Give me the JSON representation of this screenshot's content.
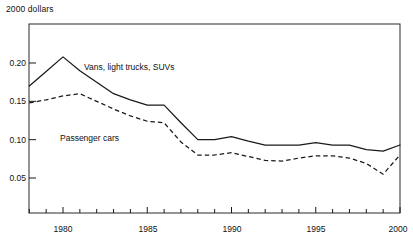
{
  "chart_data": {
    "type": "line",
    "title": "2000 dollars",
    "xlabel": "",
    "ylabel": "",
    "xlim": [
      1978,
      2000
    ],
    "ylim": [
      0.0,
      0.225
    ],
    "grid": false,
    "legend_position": "inline-annotations",
    "x_ticks_major": [
      1980,
      1985,
      1990,
      1995,
      2000
    ],
    "x_tick_labels": [
      "1980",
      "1985",
      "1990",
      "1995",
      "2000"
    ],
    "x_ticks_minor_every": 1,
    "y_ticks": [
      0.05,
      0.1,
      0.15,
      0.2
    ],
    "y_tick_labels": [
      "0.05",
      "0.10",
      "0.15",
      "0.20"
    ],
    "x": [
      1978,
      1979,
      1980,
      1981,
      1982,
      1983,
      1984,
      1985,
      1986,
      1987,
      1988,
      1989,
      1990,
      1991,
      1992,
      1993,
      1994,
      1995,
      1996,
      1997,
      1998,
      1999,
      2000
    ],
    "series": [
      {
        "name": "Vans, light trucks, SUVs",
        "style": "solid",
        "color": "#1a1a1a",
        "values": [
          0.17,
          0.189,
          0.208,
          0.19,
          0.175,
          0.16,
          0.152,
          0.145,
          0.145,
          0.122,
          0.1,
          0.1,
          0.104,
          0.098,
          0.093,
          0.093,
          0.093,
          0.096,
          0.093,
          0.093,
          0.087,
          0.085,
          0.093
        ],
        "label_text": "Vans, light trucks, SUVs"
      },
      {
        "name": "Passenger cars",
        "style": "dashed",
        "color": "#1a1a1a",
        "values": [
          0.148,
          0.152,
          0.157,
          0.16,
          0.15,
          0.14,
          0.131,
          0.124,
          0.122,
          0.097,
          0.08,
          0.08,
          0.083,
          0.078,
          0.073,
          0.072,
          0.076,
          0.079,
          0.079,
          0.076,
          0.069,
          0.055,
          0.08
        ],
        "label_text": "Passenger cars"
      }
    ],
    "annotations": [
      {
        "name": "vans-label",
        "text": "Vans, light trucks, SUVs",
        "x_px": 84,
        "y_px": 68
      },
      {
        "name": "cars-label",
        "text": "Passenger cars",
        "x_px": 60,
        "y_px": 139
      }
    ]
  },
  "axis_title": "2000 dollars",
  "y_labels": [
    "0.20",
    "0.15",
    "0.10",
    "0.05"
  ],
  "x_labels": [
    "1980",
    "1985",
    "1990",
    "1995",
    "2000"
  ],
  "series_labels": {
    "vans": "Vans, light trucks, SUVs",
    "cars": "Passenger cars"
  },
  "colors": {
    "line": "#1a1a1a",
    "frame": "#2b2b2b",
    "background": "#ffffff",
    "text": "#111111"
  }
}
